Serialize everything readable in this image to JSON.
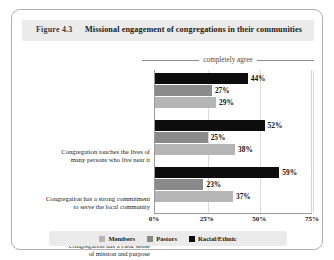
{
  "figure": {
    "number": "Figure 4.3",
    "title": "Missional engagement of congregations in their communities",
    "agree_label": "completely agree"
  },
  "colors": {
    "members": "#b5b5b5",
    "pastors": "#8a8a8a",
    "racial_ethnic": "#0d0d0d",
    "band_background": "#ebebeb",
    "border": "#b0b0b0",
    "gridline": "#d9d9d9"
  },
  "chart_data": {
    "type": "bar",
    "orientation": "horizontal",
    "title": "Missional engagement of congregations in their communities",
    "subtitle": "completely agree",
    "xlabel": "",
    "ylabel": "",
    "xlim": [
      0,
      75
    ],
    "grid": true,
    "legend_position": "bottom",
    "tick_labels": [
      "0%",
      "25%",
      "50%",
      "75%"
    ],
    "tick_values": [
      0,
      25,
      50,
      75
    ],
    "categories": [
      "Congregation touches the lives of many persons who live near it",
      "Congregation has a strong commitment to serve the local community",
      "Congregation has a clear sense of mission and purpose"
    ],
    "categories_lines": [
      [
        "Congregation touches the lives of",
        "many persons who live near it"
      ],
      [
        "Congregation has a strong commitment",
        "to serve the local community"
      ],
      [
        "Congregation has a clear sense",
        "of mission and purpose"
      ]
    ],
    "series": [
      {
        "name": "Racial/Ethnic",
        "color": "#0d0d0d",
        "values": [
          44,
          52,
          59
        ],
        "labels": [
          "44%",
          "52%",
          "59%"
        ]
      },
      {
        "name": "Pastors",
        "color": "#8a8a8a",
        "values": [
          27,
          25,
          23
        ],
        "labels": [
          "27%",
          "25%",
          "23%"
        ]
      },
      {
        "name": "Members",
        "color": "#b5b5b5",
        "values": [
          29,
          38,
          37
        ],
        "labels": [
          "29%",
          "38%",
          "37%"
        ]
      }
    ],
    "legend": [
      {
        "name": "Members",
        "color": "#b5b5b5"
      },
      {
        "name": "Pastors",
        "color": "#8a8a8a"
      },
      {
        "name": "Racial/Ethnic",
        "color": "#0d0d0d"
      }
    ]
  }
}
